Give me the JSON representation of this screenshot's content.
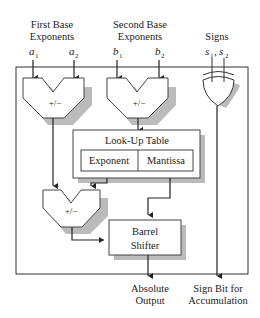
{
  "labels": {
    "first_base_line1": "First Base",
    "first_base_line2": "Exponents",
    "second_base_line1": "Second Base",
    "second_base_line2": "Exponents",
    "signs": "Signs",
    "a1": "a",
    "a1_sub": "1",
    "a2": "a",
    "a2_sub": "2",
    "b1": "b",
    "b1_sub": "1",
    "b2": "b",
    "b2_sub": "2",
    "s12": "s",
    "s1_sub": "1",
    "comma": ", ",
    "s2": "s",
    "s2_sub": "2"
  },
  "blocks": {
    "adder1": "+/−",
    "adder2": "+/−",
    "adder3": "+/−",
    "lut_title": "Look-Up Table",
    "lut_exponent": "Exponent",
    "lut_mantissa": "Mantissa",
    "barrel_line1": "Barrel",
    "barrel_line2": "Shifter"
  },
  "outputs": {
    "absolute_line1": "Absolute",
    "absolute_line2": "Output",
    "sign_line1": "Sign Bit for",
    "sign_line2": "Accumulation"
  }
}
